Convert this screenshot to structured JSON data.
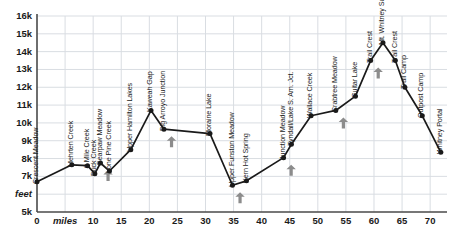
{
  "chart_data": {
    "type": "line",
    "title": "",
    "xlabel": "miles",
    "ylabel": "feet",
    "xlim": [
      0,
      73
    ],
    "ylim": [
      5000,
      16000
    ],
    "grid": true,
    "legend": "none",
    "xticks": [
      0,
      5,
      10,
      15,
      20,
      25,
      30,
      35,
      40,
      45,
      50,
      55,
      60,
      65,
      70
    ],
    "xtick_labels": [
      "0",
      "miles",
      "10",
      "15",
      "20",
      "25",
      "30",
      "35",
      "40",
      "45",
      "50",
      "55",
      "60",
      "65",
      "70"
    ],
    "yticks": [
      5000,
      6000,
      7000,
      8000,
      9000,
      10000,
      11000,
      12000,
      13000,
      14000,
      15000,
      16000
    ],
    "ytick_labels": [
      "5k",
      "feet",
      "7k",
      "8k",
      "9k",
      "10k",
      "11k",
      "12k",
      "13k",
      "14k",
      "15k",
      "16k"
    ],
    "series": [
      {
        "name": "High Sierra Trail elevation profile",
        "points": [
          {
            "label": "Crescent Meadow",
            "x": 0.0,
            "y": 6700,
            "arrow": false
          },
          {
            "label": "Mehrten Creek",
            "x": 6.2,
            "y": 7650,
            "arrow": false
          },
          {
            "label": "9 Mile Creek",
            "x": 9.0,
            "y": 7600,
            "arrow": false
          },
          {
            "label": "Buck Creek",
            "x": 10.3,
            "y": 7150,
            "arrow": false
          },
          {
            "label": "Bearpaw Meadow",
            "x": 11.3,
            "y": 7750,
            "arrow": true
          },
          {
            "label": "Lone Pine Creek",
            "x": 12.9,
            "y": 7300,
            "arrow": false
          },
          {
            "label": "Upper Hamilton Lakes",
            "x": 16.7,
            "y": 8500,
            "arrow": false
          },
          {
            "label": "Kaweah Gap",
            "x": 20.3,
            "y": 10700,
            "arrow": false
          },
          {
            "label": "Big Arroyo Junction",
            "x": 22.6,
            "y": 9650,
            "arrow": true
          },
          {
            "label": "Moraine Lake",
            "x": 30.8,
            "y": 9400,
            "arrow": false
          },
          {
            "label": "Upper Funston Meadow",
            "x": 34.8,
            "y": 6500,
            "arrow": true
          },
          {
            "label": "Kern Hot Spring",
            "x": 37.3,
            "y": 6750,
            "arrow": false
          },
          {
            "label": "Junction Meadow",
            "x": 43.9,
            "y": 8050,
            "arrow": true
          },
          {
            "label": "Tyndall/Lake S. Am. Jct.",
            "x": 45.3,
            "y": 8800,
            "arrow": false
          },
          {
            "label": "Wallace Creek",
            "x": 48.8,
            "y": 10400,
            "arrow": false
          },
          {
            "label": "Crabtree Meadow",
            "x": 53.2,
            "y": 10700,
            "arrow": true
          },
          {
            "label": "Guitar Lake",
            "x": 56.7,
            "y": 11500,
            "arrow": false
          },
          {
            "label": "Trail Crest",
            "x": 59.4,
            "y": 13500,
            "arrow": true
          },
          {
            "label": "Mt. Whitney Summit",
            "x": 61.6,
            "y": 14500,
            "arrow": false
          },
          {
            "label": "Trail Crest",
            "x": 63.8,
            "y": 13500,
            "arrow": false
          },
          {
            "label": "Trail Camp",
            "x": 65.5,
            "y": 12000,
            "arrow": false
          },
          {
            "label": "Outpost Camp",
            "x": 68.6,
            "y": 10400,
            "arrow": false
          },
          {
            "label": "Whitney Portal",
            "x": 71.9,
            "y": 8350,
            "arrow": false
          }
        ]
      }
    ],
    "colors": {
      "line": "#1a1a1a",
      "marker": "#1a1a1a",
      "grid": "#d9dde2",
      "axis": "#4a4a4a",
      "arrow": "#8c8c8c",
      "text": "#1a1a1a",
      "background": "#ffffff"
    }
  }
}
